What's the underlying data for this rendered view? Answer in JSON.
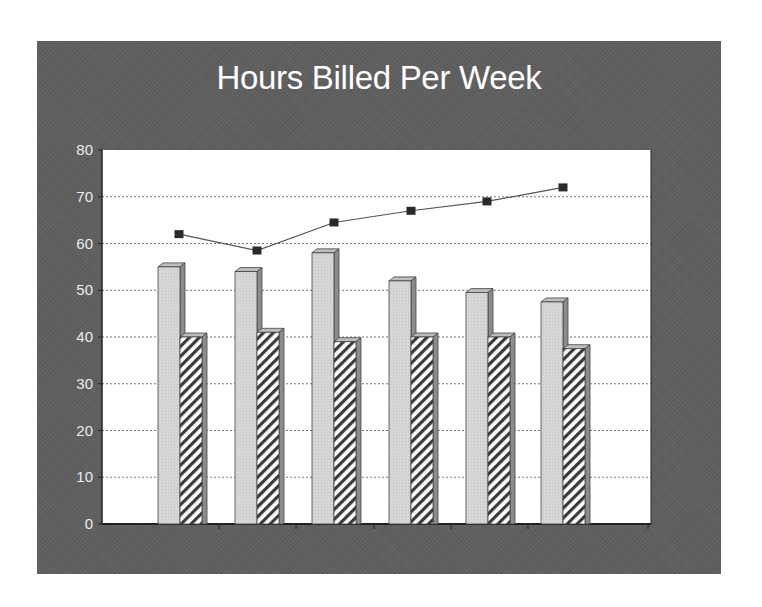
{
  "chart_data": {
    "type": "bar",
    "title": "Hours Billed Per Week",
    "xlabel": "",
    "ylabel": "",
    "ylim": [
      0,
      80
    ],
    "yticks": [
      0,
      10,
      20,
      30,
      40,
      50,
      60,
      70,
      80
    ],
    "grid": true,
    "legend": "none",
    "categories": [
      "1",
      "2",
      "3",
      "4",
      "5",
      "6"
    ],
    "series": [
      {
        "name": "Series 1",
        "type": "bar",
        "style": "solid light gray, 3D",
        "values": [
          55,
          54,
          58,
          52,
          49.5,
          47.5
        ]
      },
      {
        "name": "Series 2",
        "type": "bar",
        "style": "diagonal hatched, 3D",
        "values": [
          40,
          41,
          39,
          40,
          40,
          37.5
        ]
      },
      {
        "name": "Series 3",
        "type": "line",
        "style": "dark square markers",
        "values": [
          62,
          58.5,
          64.5,
          67,
          69,
          72
        ]
      }
    ]
  },
  "colors": {
    "panel": "#5f5f5f",
    "plot_bg": "#ffffff",
    "bar_solid": "#d4d4d4",
    "bar_side": "#8c8c8c",
    "hatch": "#3a3a3a",
    "marker": "#2a2a2a",
    "title_text": "#ffffff",
    "tick_text": "#ececec"
  }
}
